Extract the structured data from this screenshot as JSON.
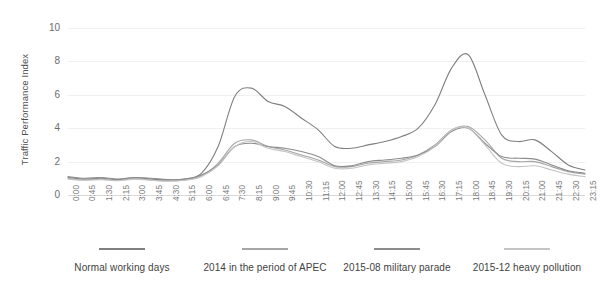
{
  "chart_data": {
    "type": "line",
    "title": "",
    "xlabel": "",
    "ylabel": "Traffic Performance Index",
    "ylim": [
      0,
      10
    ],
    "yticks": [
      0,
      2,
      4,
      6,
      8,
      10
    ],
    "grid": true,
    "legend_position": "bottom",
    "x": [
      "0:00",
      "0:45",
      "1:30",
      "2:15",
      "3:00",
      "3:45",
      "4:30",
      "5:15",
      "6:00",
      "6:45",
      "7:30",
      "8:15",
      "9:00",
      "9:45",
      "10:30",
      "11:15",
      "12:00",
      "12:45",
      "13:30",
      "14:15",
      "15:00",
      "15:45",
      "16:30",
      "17:15",
      "18:00",
      "18:45",
      "19:30",
      "20:15",
      "21:00",
      "21:45",
      "22:30",
      "23:15"
    ],
    "categories": [
      "0:00",
      "0:45",
      "1:30",
      "2:15",
      "3:00",
      "3:45",
      "4:30",
      "5:15",
      "6:00",
      "6:45",
      "7:30",
      "8:15",
      "9:00",
      "9:45",
      "10:30",
      "11:15",
      "12:00",
      "12:45",
      "13:30",
      "14:15",
      "15:00",
      "15:45",
      "16:30",
      "17:15",
      "18:00",
      "18:45",
      "19:30",
      "20:15",
      "21:00",
      "21:45",
      "22:30",
      "23:15"
    ],
    "series": [
      {
        "name": "Normal working days",
        "color": "#7f7f7f",
        "values": [
          1.05,
          0.95,
          1.0,
          0.92,
          1.05,
          0.95,
          0.9,
          0.95,
          1.3,
          2.9,
          5.9,
          6.4,
          5.6,
          5.3,
          4.6,
          3.9,
          2.9,
          2.8,
          3.0,
          3.2,
          3.5,
          4.0,
          5.4,
          7.6,
          8.4,
          6.0,
          3.6,
          3.2,
          3.3,
          2.6,
          1.8,
          1.5
        ]
      },
      {
        "name": "2014 in the period of APEC",
        "color": "#a6a6a6",
        "values": [
          1.0,
          0.9,
          0.95,
          0.88,
          0.98,
          0.9,
          0.85,
          0.9,
          1.15,
          1.9,
          3.1,
          3.3,
          2.9,
          2.7,
          2.4,
          2.1,
          1.7,
          1.7,
          1.9,
          2.0,
          2.1,
          2.4,
          3.0,
          3.9,
          4.1,
          3.3,
          2.2,
          2.0,
          2.0,
          1.7,
          1.4,
          1.25
        ]
      },
      {
        "name": "2015-08 military parade",
        "color": "#8c8c8c",
        "values": [
          1.1,
          1.0,
          1.05,
          0.95,
          1.05,
          1.0,
          0.92,
          0.95,
          1.2,
          1.8,
          2.9,
          3.1,
          2.9,
          2.8,
          2.6,
          2.3,
          1.75,
          1.75,
          2.0,
          2.1,
          2.2,
          2.4,
          2.9,
          3.8,
          4.0,
          3.1,
          2.3,
          2.2,
          2.15,
          1.8,
          1.45,
          1.3
        ]
      },
      {
        "name": "2015-12 heavy pollution",
        "color": "#c4c4c4",
        "values": [
          0.95,
          0.88,
          0.92,
          0.85,
          0.95,
          0.88,
          0.82,
          0.88,
          1.1,
          1.75,
          2.9,
          3.2,
          2.8,
          2.6,
          2.3,
          2.0,
          1.6,
          1.6,
          1.8,
          1.9,
          2.0,
          2.3,
          2.9,
          3.9,
          4.0,
          3.0,
          1.9,
          1.7,
          1.75,
          1.5,
          1.25,
          1.1
        ]
      }
    ]
  },
  "axis": {
    "y_title": "Traffic Performance Index"
  },
  "legend": {
    "items": [
      {
        "label": "Normal working days",
        "color": "#7f7f7f",
        "left": 52,
        "width": 140
      },
      {
        "label": "2014 in the period of APEC",
        "color": "#a6a6a6",
        "left": 185,
        "width": 160
      },
      {
        "label": "2015-08 military parade",
        "color": "#8c8c8c",
        "left": 322,
        "width": 150
      },
      {
        "label": "2015-12 heavy pollution",
        "color": "#c4c4c4",
        "left": 452,
        "width": 150
      }
    ]
  }
}
